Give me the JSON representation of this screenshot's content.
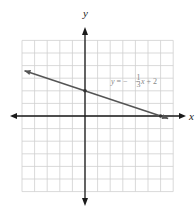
{
  "chart_data": {
    "type": "line",
    "title": "",
    "xlabel": "x",
    "ylabel": "y",
    "xlim": [
      -5,
      7
    ],
    "ylim": [
      -6,
      6
    ],
    "grid": true,
    "grid_step": 1,
    "tick_labels": false,
    "series": [
      {
        "name": "y = -1/3 x + 2",
        "equation": "y = -⅓x + 2",
        "slope": -0.3333,
        "intercept": 2,
        "x": [
          -4.8,
          0,
          6,
          6.6
        ],
        "y": [
          3.6,
          2,
          0,
          -0.2
        ],
        "marked_points": [
          {
            "x": 0,
            "y": 2,
            "label": "y-intercept"
          },
          {
            "x": 6,
            "y": 0,
            "label": "x-intercept"
          }
        ],
        "arrows": "both"
      }
    ],
    "annotations": [
      {
        "text": "y = -1/3 x + 2",
        "x": 2.2,
        "y": 2.8
      }
    ]
  },
  "labels": {
    "x_axis": "x",
    "y_axis": "y",
    "eq_y": "y",
    "eq_equals": " = −",
    "eq_num": "1",
    "eq_den": "3",
    "eq_x": "x",
    "eq_tail": " + 2"
  },
  "colors": {
    "grid": "#cfcfcf",
    "axis": "#1a1a1a",
    "line": "#555555",
    "point": "#333333"
  }
}
